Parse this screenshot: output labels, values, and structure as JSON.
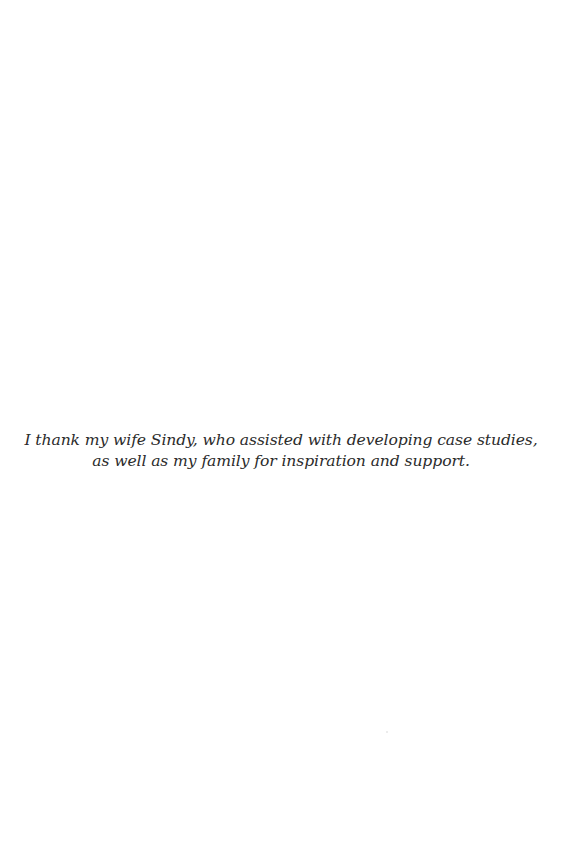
{
  "page": {
    "background": "#ffffff",
    "text_color": "#2b2b2b"
  },
  "dedication": {
    "lines": [
      "I thank my wife Sindy, who assisted with developing case studies,",
      "as well as my family for inspiration and support."
    ]
  }
}
